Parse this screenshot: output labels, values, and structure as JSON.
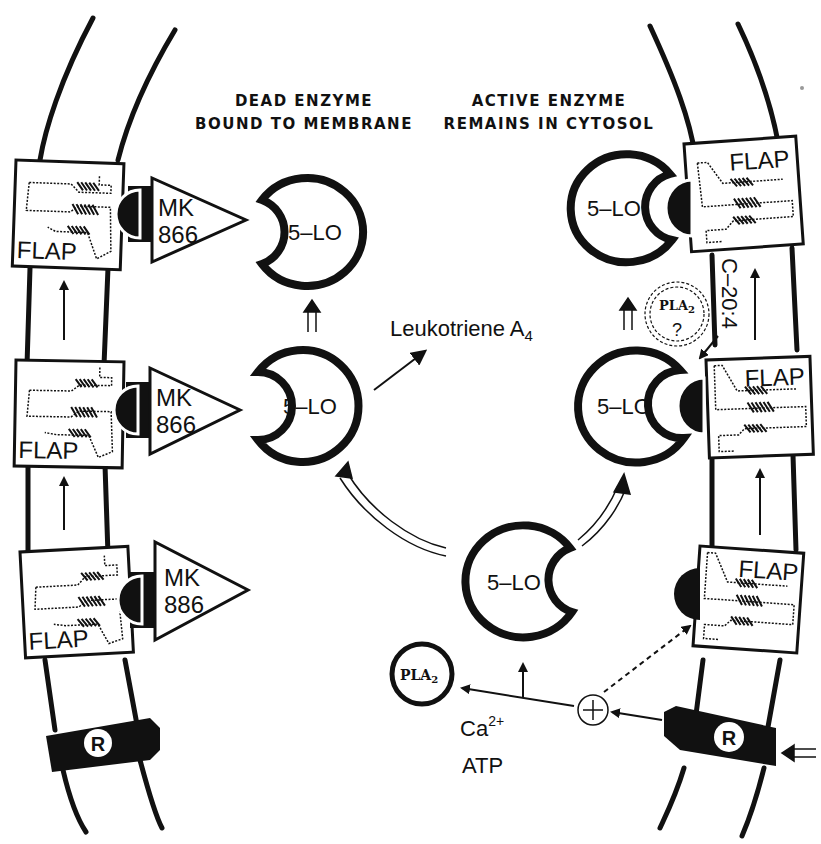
{
  "headings": {
    "left_line1": "DEAD ENZYME",
    "left_line2": "BOUND TO MEMBRANE",
    "right_line1": "ACTIVE ENZYME",
    "right_line2": "REMAINS IN CYTOSOL"
  },
  "labels": {
    "flap": "FLAP",
    "five_lo": "5–LO",
    "receptor": "R",
    "leukotriene": "Leukotriene A",
    "leukotriene_sub": "4",
    "pla2": "PLA",
    "pla2_sub": "2",
    "pla2_question": "?",
    "c20_4": "C–20:4",
    "ca": "Ca",
    "ca_sup": "2+",
    "atp": "ATP",
    "plus": "+"
  },
  "left_membrane": {
    "flap_units": [
      {
        "inhibitor_line1": "MK",
        "inhibitor_line2": "866"
      },
      {
        "inhibitor_line1": "MK",
        "inhibitor_line2": "866"
      },
      {
        "inhibitor_line1": "MK",
        "inhibitor_line2": "886"
      }
    ]
  },
  "colors": {
    "ink": "#111111",
    "background": "#ffffff"
  }
}
